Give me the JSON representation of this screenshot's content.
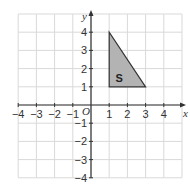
{
  "diagram": {
    "title": "",
    "grid": {
      "xmin": -4,
      "xmax": 5,
      "ymin": -4,
      "ymax": 5,
      "step": 1
    },
    "axes": {
      "x_label": "x",
      "y_label": "y",
      "origin_label": "O"
    },
    "x_ticks": [
      "-4",
      "-3",
      "-2",
      "-1",
      "1",
      "2",
      "3",
      "4"
    ],
    "y_ticks": [
      "4",
      "3",
      "2",
      "1",
      "-1",
      "-2",
      "-3",
      "-4"
    ],
    "shape": {
      "label": "S",
      "vertices": [
        [
          1,
          4
        ],
        [
          1,
          1
        ],
        [
          3,
          1
        ]
      ],
      "fill": "#b3b3b3",
      "stroke": "#333333"
    },
    "colors": {
      "grid": "#d9d9d9",
      "axis": "#333333"
    }
  }
}
